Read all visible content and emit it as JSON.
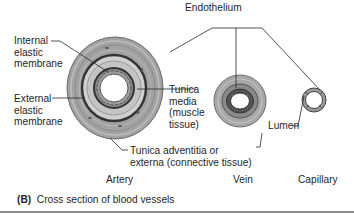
{
  "figure": {
    "panel_letter": "(B)",
    "caption": "Cross section of blood vessels"
  },
  "labels": {
    "endothelium": "Endothelium",
    "internal_elastic": [
      "Internal",
      "elastic",
      "membrane"
    ],
    "external_elastic": [
      "External",
      "elastic",
      "membrane"
    ],
    "tunica_media": [
      "Tunica",
      "media",
      "(muscle",
      "tissue)"
    ],
    "tunica_adventitia": [
      "Tunica adventitia or",
      "externa (connective tissue)"
    ],
    "lumen": "Lumen"
  },
  "vessels": {
    "artery": "Artery",
    "vein": "Vein",
    "capillary": "Capillary"
  },
  "colors": {
    "adventitia": "#9a9a9a",
    "adventitia_light": "#b8b8b8",
    "media": "#c8c8c8",
    "elastic": "#3a3a3a",
    "endothelium": "#7a7a7a",
    "lumen": "#ffffff",
    "leader": "#2a2a2a"
  }
}
